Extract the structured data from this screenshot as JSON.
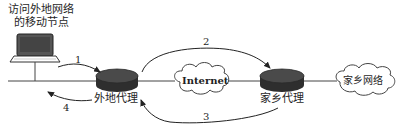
{
  "diagram": {
    "mobile_node_label_line1": "访问外地网络",
    "mobile_node_label_line2": "的移动节点",
    "foreign_agent_label": "外地代理",
    "home_agent_label": "家乡代理",
    "internet_label": "Internet",
    "home_network_label": "家乡网络",
    "steps": {
      "s1": "1",
      "s2": "2",
      "s3": "3",
      "s4": "4"
    },
    "colors": {
      "line": "#333333",
      "router": "#3a3a3a",
      "router_top": "#4a4a4a",
      "background": "#ffffff"
    }
  }
}
